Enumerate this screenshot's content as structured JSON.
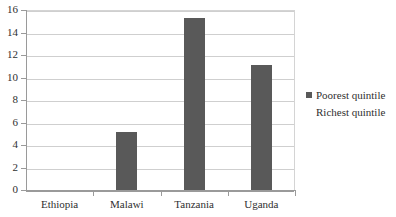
{
  "chart_data": {
    "type": "bar",
    "title": "",
    "subtitle": "",
    "xlabel": "",
    "ylabel": "",
    "categories": [
      "Ethiopia",
      "Malawi",
      "Tanzania",
      "Uganda"
    ],
    "series": [
      {
        "name": "Poorest quintile",
        "color": "#595959",
        "values": [
          0,
          5.2,
          15.3,
          11.1
        ]
      },
      {
        "name": "Richest quintile",
        "color": "#595959",
        "values": [
          0,
          0,
          0,
          0
        ]
      }
    ],
    "ylim": [
      0,
      16
    ],
    "ytick_step": 2,
    "yticks": [
      0,
      2,
      4,
      6,
      8,
      10,
      12,
      14,
      16
    ],
    "ytick_labels": [
      "0",
      "2",
      "4",
      "6",
      "8",
      "10",
      "12",
      "14",
      "16"
    ],
    "grid": true,
    "grid_axis": "y",
    "legend_position": "right",
    "legend_entries": [
      "Poorest quintile",
      "Richest quintile"
    ],
    "colors": {
      "bar": "#595959",
      "gridline": "#cfcfcf",
      "axis": "#9a9a9a",
      "text": "#2f2f2f",
      "background": "#ffffff"
    }
  }
}
